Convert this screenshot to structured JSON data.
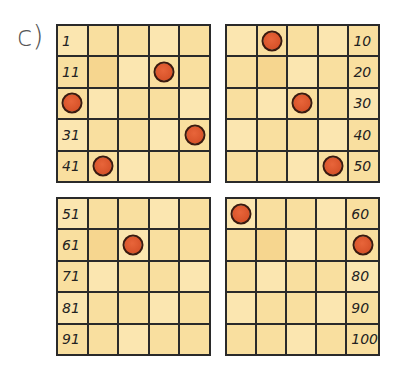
{
  "exercise_label": "c)",
  "grids": [
    {
      "name": "top-left",
      "rows": [
        [
          "1",
          "",
          "",
          "",
          ""
        ],
        [
          "11",
          "",
          "",
          "",
          ""
        ],
        [
          "",
          "",
          "",
          "",
          ""
        ],
        [
          "31",
          "",
          "",
          "",
          ""
        ],
        [
          "41",
          "",
          "",
          "",
          ""
        ]
      ],
      "dots": [
        [
          1,
          3
        ],
        [
          2,
          0
        ],
        [
          3,
          4
        ],
        [
          4,
          1
        ]
      ]
    },
    {
      "name": "top-right",
      "rows": [
        [
          "",
          "",
          "",
          "",
          "10"
        ],
        [
          "",
          "",
          "",
          "",
          "20"
        ],
        [
          "",
          "",
          "",
          "",
          "30"
        ],
        [
          "",
          "",
          "",
          "",
          "40"
        ],
        [
          "",
          "",
          "",
          "",
          "50"
        ]
      ],
      "dots": [
        [
          0,
          1
        ],
        [
          2,
          2
        ],
        [
          4,
          3
        ]
      ]
    },
    {
      "name": "bottom-left",
      "rows": [
        [
          "51",
          "",
          "",
          "",
          ""
        ],
        [
          "61",
          "",
          "",
          "",
          ""
        ],
        [
          "71",
          "",
          "",
          "",
          ""
        ],
        [
          "81",
          "",
          "",
          "",
          ""
        ],
        [
          "91",
          "",
          "",
          "",
          ""
        ]
      ],
      "dots": [
        [
          1,
          2
        ]
      ]
    },
    {
      "name": "bottom-right",
      "rows": [
        [
          "",
          "",
          "",
          "",
          "60"
        ],
        [
          "",
          "",
          "",
          "",
          ""
        ],
        [
          "",
          "",
          "",
          "",
          "80"
        ],
        [
          "",
          "",
          "",
          "",
          "90"
        ],
        [
          "",
          "",
          "",
          "",
          "100"
        ]
      ],
      "dots": [
        [
          0,
          0
        ],
        [
          1,
          4
        ]
      ]
    }
  ],
  "colors": {
    "cell": "#f9df9f",
    "dot": "#d9532a",
    "border": "#2a2a2a"
  }
}
